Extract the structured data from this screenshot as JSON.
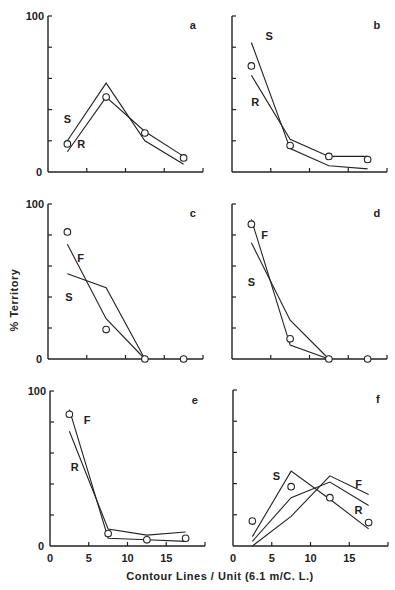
{
  "figure": {
    "ylabel": "% Territory",
    "xlabel": "Contour Lines / Unit",
    "xlabel_unit": "(6.1 m/C. L.)"
  },
  "chart_data": [
    {
      "type": "line",
      "panel": "a",
      "x": [
        2.5,
        7.5,
        12.5,
        17.5
      ],
      "series": [
        {
          "name": "S",
          "values": [
            20,
            57,
            20,
            5
          ]
        },
        {
          "name": "R",
          "values": [
            13,
            48,
            26,
            10
          ]
        },
        {
          "name": "observed",
          "marker": "circle",
          "values": [
            18,
            48,
            25,
            9
          ]
        }
      ],
      "xlabel": "Contour Lines / Unit (6.1 m/C. L.)",
      "ylabel": "% Territory",
      "xlim": [
        0,
        20
      ],
      "ylim": [
        0,
        100
      ],
      "xticks": [
        0,
        5,
        10,
        15
      ],
      "yticks": [
        0,
        100
      ]
    },
    {
      "type": "line",
      "panel": "b",
      "x": [
        2.5,
        7.5,
        12.5,
        17.5
      ],
      "series": [
        {
          "name": "S",
          "values": [
            83,
            15,
            4,
            2
          ]
        },
        {
          "name": "R",
          "values": [
            62,
            21,
            10,
            10
          ]
        },
        {
          "name": "observed",
          "marker": "circle",
          "values": [
            68,
            17,
            10,
            8
          ]
        }
      ],
      "xlim": [
        0,
        20
      ],
      "ylim": [
        0,
        100
      ]
    },
    {
      "type": "line",
      "panel": "c",
      "x": [
        2.5,
        7.5,
        12.5,
        17.5
      ],
      "series": [
        {
          "name": "F",
          "values": [
            74,
            26,
            0,
            null
          ]
        },
        {
          "name": "S",
          "values": [
            55,
            46,
            0,
            null
          ]
        },
        {
          "name": "observed",
          "marker": "circle",
          "values": [
            82,
            19,
            0,
            0
          ]
        }
      ],
      "xlim": [
        0,
        20
      ],
      "ylim": [
        0,
        100
      ],
      "yticks": [
        0,
        100
      ]
    },
    {
      "type": "line",
      "panel": "d",
      "x": [
        2.5,
        7.5,
        12.5,
        17.5
      ],
      "series": [
        {
          "name": "F",
          "values": [
            90,
            9,
            0,
            null
          ]
        },
        {
          "name": "S",
          "values": [
            75,
            25,
            0,
            null
          ]
        },
        {
          "name": "observed",
          "marker": "circle",
          "values": [
            87,
            13,
            0,
            0
          ]
        }
      ],
      "xlim": [
        0,
        20
      ],
      "ylim": [
        0,
        100
      ]
    },
    {
      "type": "line",
      "panel": "e",
      "x": [
        2.5,
        7.5,
        12.5,
        17.5
      ],
      "series": [
        {
          "name": "F",
          "values": [
            88,
            5,
            4,
            3
          ]
        },
        {
          "name": "R",
          "values": [
            74,
            11,
            7,
            9
          ]
        },
        {
          "name": "observed",
          "marker": "circle",
          "values": [
            85,
            8,
            4,
            5
          ]
        }
      ],
      "xlim": [
        0,
        20
      ],
      "ylim": [
        0,
        100
      ],
      "xticks": [
        0,
        5,
        10,
        15
      ],
      "yticks": [
        0,
        100
      ]
    },
    {
      "type": "line",
      "panel": "f",
      "x": [
        2.5,
        7.5,
        12.5,
        17.5
      ],
      "series": [
        {
          "name": "S",
          "values": [
            6,
            48,
            30,
            11
          ]
        },
        {
          "name": "F",
          "values": [
            0,
            19,
            45,
            33
          ]
        },
        {
          "name": "R",
          "values": [
            3,
            31,
            41,
            26
          ]
        },
        {
          "name": "observed",
          "marker": "circle",
          "values": [
            16,
            38,
            31,
            15
          ]
        }
      ],
      "xlim": [
        0,
        20
      ],
      "ylim": [
        0,
        100
      ],
      "xticks": [
        0,
        5,
        10,
        15
      ]
    }
  ],
  "panels": [
    {
      "letter": "a",
      "y100": "100",
      "y0": "0"
    },
    {
      "letter": "b"
    },
    {
      "letter": "c",
      "y100": "100",
      "y0": "0"
    },
    {
      "letter": "d"
    },
    {
      "letter": "e",
      "y100": "100",
      "y0": "0"
    },
    {
      "letter": "f"
    }
  ],
  "xticks": [
    "0",
    "5",
    "10",
    "15"
  ]
}
